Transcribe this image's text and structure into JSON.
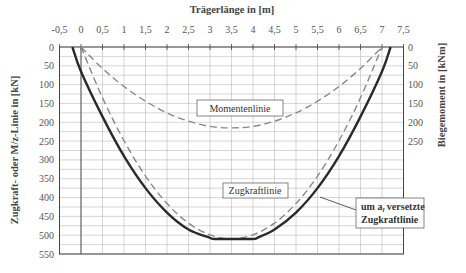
{
  "chart_data": {
    "type": "line",
    "title": "",
    "xlabel": "Trägerlänge in [m]",
    "ylabel": "Zugkraft- oder M/z-Linie in [kN]",
    "y2label": "Biegemoment in [kNm]",
    "xlim": [
      -0.5,
      7.5
    ],
    "ylim": [
      0,
      550
    ],
    "y_inverted": true,
    "y2lim": [
      0,
      250
    ],
    "x_ticks": [
      "-0,5",
      "0",
      "0,5",
      "1",
      "1,5",
      "2",
      "2,5",
      "3",
      "3,5",
      "4",
      "4,5",
      "5",
      "5,5",
      "6",
      "6,5",
      "7",
      "7,5"
    ],
    "y_ticks": [
      "0",
      "50",
      "100",
      "150",
      "200",
      "250",
      "300",
      "350",
      "400",
      "450",
      "500",
      "550"
    ],
    "y2_ticks": [
      "0",
      "50",
      "100",
      "150",
      "200",
      "250"
    ],
    "grid": true,
    "series": [
      {
        "name": "Momentenlinie",
        "style": "dashed",
        "axis": "right",
        "x": [
          0,
          0.5,
          1,
          1.5,
          2,
          2.5,
          3,
          3.5,
          4,
          4.5,
          5,
          5.5,
          6,
          6.5,
          7
        ],
        "values": [
          0,
          57,
          105,
          144,
          175,
          197,
          211,
          215,
          211,
          197,
          175,
          144,
          105,
          57,
          0
        ]
      },
      {
        "name": "Zugkraftlinie",
        "style": "dashed",
        "axis": "left",
        "x": [
          0,
          0.5,
          1,
          1.5,
          2,
          2.5,
          3,
          3.5,
          4,
          4.5,
          5,
          5.5,
          6,
          6.5,
          7
        ],
        "values": [
          0,
          135,
          249,
          343,
          416,
          468,
          499,
          510,
          499,
          468,
          416,
          343,
          249,
          135,
          0
        ]
      },
      {
        "name": "um a_l versetzte Zugkraftlinie",
        "style": "solid",
        "axis": "left",
        "x": [
          -0.2,
          0,
          0.5,
          1,
          1.5,
          2,
          2.5,
          3,
          3.1,
          3.5,
          4,
          4.1,
          4.5,
          5,
          5.5,
          6,
          6.5,
          7,
          7.2
        ],
        "values": [
          0,
          65,
          185,
          290,
          375,
          440,
          485,
          507,
          510,
          510,
          510,
          507,
          485,
          440,
          375,
          290,
          185,
          65,
          0
        ]
      }
    ],
    "annotations": [
      {
        "text": "Momentenlinie",
        "x": 3.6,
        "y": 190
      },
      {
        "text": "Zugkraftlinie",
        "x": 3.6,
        "y": 420
      },
      {
        "text_line1": "um a",
        "subscript": "l",
        "text_line1_rest": " versetzte",
        "text_line2": "Zugkraftlinie",
        "x": 7.9,
        "y": 470
      }
    ]
  },
  "labels": {
    "xlabel": "Trägerlänge in [m]",
    "ylabel": "Zugkraft- oder M/z-Linie in [kN]",
    "y2label": "Biegemoment in [kNm]",
    "moment": "Momentenlinie",
    "zug": "Zugkraftlinie",
    "versetzt_a": "um a",
    "versetzt_sub": "l",
    "versetzt_rest": " versetzte",
    "versetzt_2": "Zugkraftlinie"
  }
}
